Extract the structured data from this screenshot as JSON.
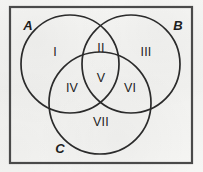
{
  "figure": {
    "type": "venn-diagram-three-set",
    "colors": {
      "paper": "#f3f3f1",
      "ink": "#1d1d1d",
      "border": "#4a4a4a",
      "circle_stroke": "#2b2b2b"
    },
    "universe_box": {
      "name": "universal-set-rectangle",
      "x": 9,
      "y": 6,
      "width": 184,
      "height": 158
    },
    "sets": [
      {
        "id": "A",
        "label": "A",
        "cx": 70,
        "cy": 64,
        "r": 49,
        "label_x": 28,
        "label_y": 25
      },
      {
        "id": "B",
        "label": "B",
        "cx": 131,
        "cy": 64,
        "r": 49,
        "label_x": 178,
        "label_y": 25
      },
      {
        "id": "C",
        "label": "C",
        "cx": 100,
        "cy": 103,
        "r": 51,
        "label_x": 60,
        "label_y": 148
      }
    ],
    "regions": [
      {
        "id": "I",
        "label": "I",
        "x": 55,
        "y": 52,
        "meaning": "A only"
      },
      {
        "id": "II",
        "label": "II",
        "x": 101,
        "y": 48,
        "meaning": "A and B only"
      },
      {
        "id": "III",
        "label": "III",
        "x": 146,
        "y": 52,
        "meaning": "B only"
      },
      {
        "id": "IV",
        "label": "IV",
        "x": 72,
        "y": 88,
        "meaning": "A and C only"
      },
      {
        "id": "V",
        "label": "V",
        "x": 101,
        "y": 78,
        "meaning": "A and B and C"
      },
      {
        "id": "VI",
        "label": "VI",
        "x": 130,
        "y": 88,
        "meaning": "B and C only"
      },
      {
        "id": "VII",
        "label": "VII",
        "x": 101,
        "y": 122,
        "meaning": "C only"
      }
    ]
  }
}
